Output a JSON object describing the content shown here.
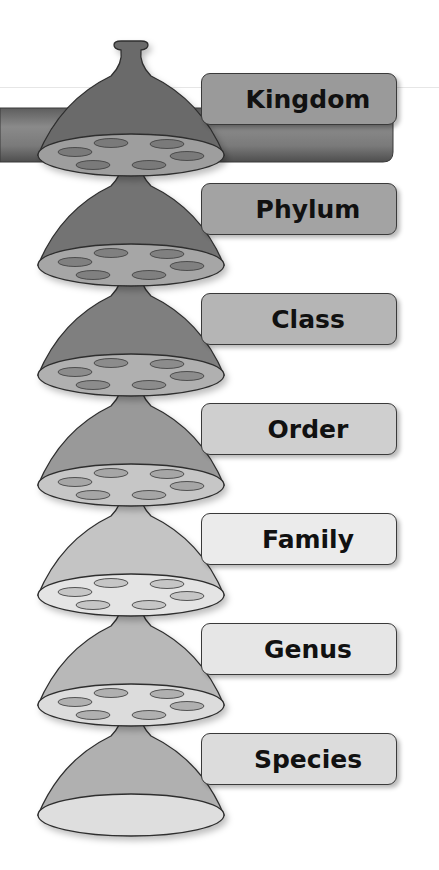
{
  "diagram": {
    "levels": [
      {
        "label": "Kingdom",
        "bell_color": "#6b6b6b",
        "rim_color": "#9e9e9e",
        "hole_color": "#7a7a7a",
        "box_color": "#9a9a9a"
      },
      {
        "label": "Phylum",
        "bell_color": "#737373",
        "rim_color": "#a6a6a6",
        "hole_color": "#808080",
        "box_color": "#a3a3a3"
      },
      {
        "label": "Class",
        "bell_color": "#7f7f7f",
        "rim_color": "#b0b0b0",
        "hole_color": "#8c8c8c",
        "box_color": "#b5b5b5"
      },
      {
        "label": "Order",
        "bell_color": "#999999",
        "rim_color": "#c6c6c6",
        "hole_color": "#a6a6a6",
        "box_color": "#cfcfcf"
      },
      {
        "label": "Family",
        "bell_color": "#c4c4c4",
        "rim_color": "#e4e4e4",
        "hole_color": "#c6c6c6",
        "box_color": "#ebebeb"
      },
      {
        "label": "Genus",
        "bell_color": "#b8b8b8",
        "rim_color": "#dcdcdc",
        "hole_color": "#b0b0b0",
        "box_color": "#e6e6e6"
      },
      {
        "label": "Species",
        "bell_color": "#b0b0b0",
        "rim_color": "#dedede",
        "hole_color": null,
        "box_color": "#dcdcdc"
      }
    ],
    "pipe_color": "#7a7a7a"
  }
}
